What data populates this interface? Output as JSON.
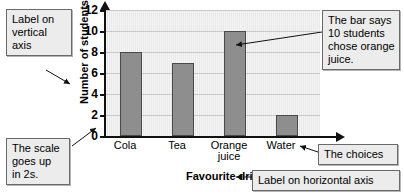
{
  "chart_data": {
    "type": "bar",
    "title": "",
    "subtitle": "",
    "categories": [
      "Cola",
      "Tea",
      "Orange juice",
      "Water"
    ],
    "category_lines": [
      [
        "Cola"
      ],
      [
        "Tea"
      ],
      [
        "Orange",
        "juice"
      ],
      [
        "Water"
      ]
    ],
    "values": [
      8,
      7,
      10,
      2
    ],
    "xlabel": "Favourite drink",
    "ylabel": "Number of students",
    "ylim": [
      0,
      12
    ],
    "ytick_step": 2,
    "ytick_labels": [
      "12",
      "10",
      "8",
      "6",
      "4",
      "2",
      "0"
    ],
    "ytick_values": [
      12,
      10,
      8,
      6,
      4,
      2,
      0
    ],
    "grid": "horizontal",
    "legend": "none",
    "bar_color": "#8e8e8e",
    "bar_border_color": "#4a4a4a",
    "plot_background": "#e9e9e9",
    "axis_color": "#111111",
    "annotations": [
      {
        "id": "vertical-axis-label",
        "lines": [
          "Label on",
          "vertical",
          "axis"
        ],
        "points_to": "ylabel"
      },
      {
        "id": "scale-note",
        "lines": [
          "The scale",
          "goes up",
          "in 2s."
        ],
        "points_to": "y-axis-ticks"
      },
      {
        "id": "orange-juice-bar-note",
        "lines": [
          "The bar says",
          "10 students",
          "chose orange",
          "juice."
        ],
        "points_to": "bar-orange-juice"
      },
      {
        "id": "choices-note",
        "lines": [
          "The choices"
        ],
        "points_to": "x-axis-categories"
      },
      {
        "id": "horizontal-axis-label",
        "lines": [
          "Label on horizontal axis"
        ],
        "points_to": "xlabel"
      }
    ]
  }
}
